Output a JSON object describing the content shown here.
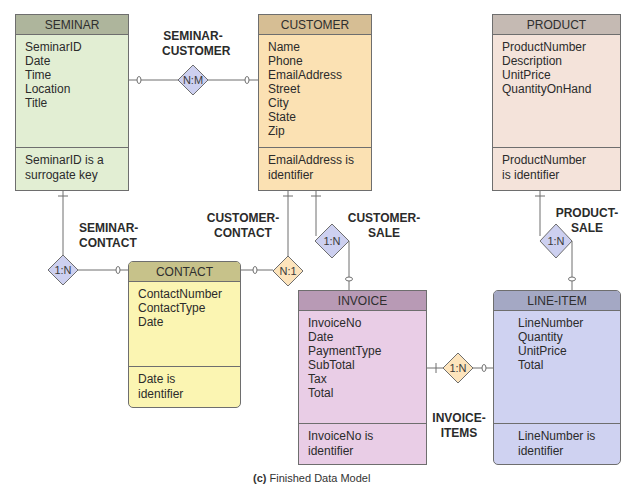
{
  "caption": {
    "prefix": "(c)",
    "text": "Finished Data Model"
  },
  "colors": {
    "seminar_body": "#e2eed3",
    "seminar_header": "#aeb59c",
    "customer_body": "#fbe1b3",
    "customer_header": "#d6be94",
    "product_body": "#f4e3da",
    "product_header": "#c5bab3",
    "contact_body": "#fbf5b2",
    "contact_header": "#c7c28a",
    "invoice_body": "#e9cde6",
    "invoice_header": "#b89ab5",
    "lineitem_body": "#cfd2f1",
    "lineitem_header": "#a4a8c4",
    "diamond_blue": "#cdd0f0",
    "diamond_orange": "#fde4bc",
    "line": "#6e6e6e"
  },
  "entities": {
    "seminar": {
      "name": "SEMINAR",
      "attributes": [
        "SeminarID",
        "Date",
        "Time",
        "Location",
        "Title"
      ],
      "identifier": [
        "SeminarID is a",
        "surrogate key"
      ]
    },
    "customer": {
      "name": "CUSTOMER",
      "attributes": [
        "Name",
        "Phone",
        "EmailAddress",
        "Street",
        "City",
        "State",
        "Zip"
      ],
      "identifier": [
        "EmailAddress is",
        "identifier"
      ]
    },
    "product": {
      "name": "PRODUCT",
      "attributes": [
        "ProductNumber",
        "Description",
        "UnitPrice",
        "QuantityOnHand"
      ],
      "identifier": [
        "ProductNumber",
        "is identifier"
      ]
    },
    "contact": {
      "name": "CONTACT",
      "attributes": [
        "ContactNumber",
        "ContactType",
        "Date"
      ],
      "identifier": [
        "Date is",
        "identifier"
      ]
    },
    "invoice": {
      "name": "INVOICE",
      "attributes": [
        "InvoiceNo",
        "Date",
        "PaymentType",
        "SubTotal",
        "Tax",
        "Total"
      ],
      "identifier": [
        "InvoiceNo is",
        "identifier"
      ]
    },
    "lineitem": {
      "name": "LINE-ITEM",
      "attributes": [
        "LineNumber",
        "Quantity",
        "UnitPrice",
        "Total"
      ],
      "identifier": [
        "LineNumber is",
        "identifier"
      ]
    }
  },
  "relationships": {
    "seminar_customer": {
      "label": [
        "SEMINAR-",
        "CUSTOMER"
      ],
      "cardinality": "N:M"
    },
    "seminar_contact": {
      "label": [
        "SEMINAR-",
        "CONTACT"
      ],
      "cardinality": "1:N"
    },
    "customer_contact": {
      "label": [
        "CUSTOMER-",
        "CONTACT"
      ],
      "cardinality": "N:1"
    },
    "customer_sale": {
      "label": [
        "CUSTOMER-",
        "SALE"
      ],
      "cardinality": "1:N"
    },
    "product_sale": {
      "label": [
        "PRODUCT-",
        "SALE"
      ],
      "cardinality": "1:N"
    },
    "invoice_items": {
      "label": [
        "INVOICE-",
        "ITEMS"
      ],
      "cardinality": "1:N"
    }
  }
}
